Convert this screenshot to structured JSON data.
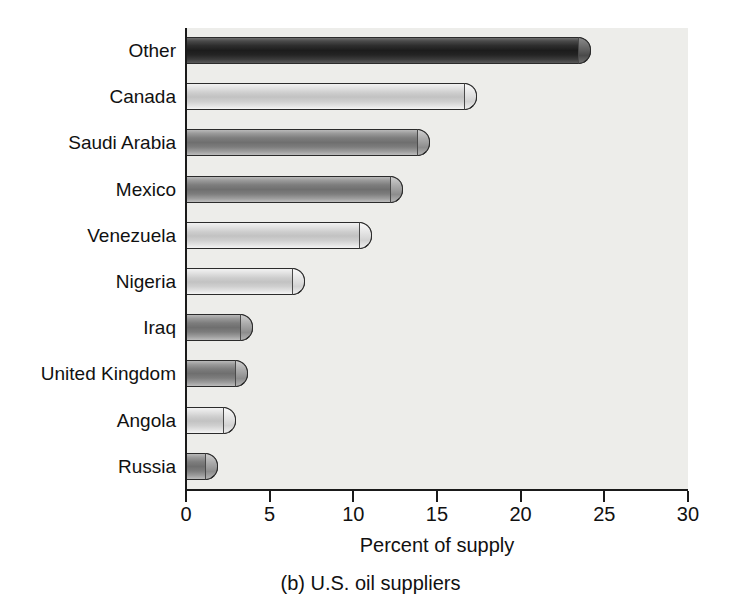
{
  "chart_data": {
    "type": "bar",
    "orientation": "horizontal",
    "title": "",
    "caption": "(b) U.S. oil suppliers",
    "xlabel": "Percent of supply",
    "ylabel": "",
    "xlim": [
      0,
      30
    ],
    "xticks": [
      0,
      5,
      10,
      15,
      20,
      25,
      30
    ],
    "xticklabels": [
      "0",
      "5",
      "10",
      "15",
      "20",
      "25",
      "30"
    ],
    "grid": false,
    "legend": null,
    "categories": [
      "Other",
      "Canada",
      "Saudi Arabia",
      "Mexico",
      "Venezuela",
      "Nigeria",
      "Iraq",
      "United Kingdom",
      "Angola",
      "Russia"
    ],
    "values": [
      24.2,
      17.4,
      14.6,
      13.0,
      11.1,
      7.1,
      4.0,
      3.7,
      3.0,
      1.9
    ],
    "bars": [
      {
        "label": "Other",
        "value": 24.2,
        "tone": "tone-dark"
      },
      {
        "label": "Canada",
        "value": 17.4,
        "tone": "tone-light"
      },
      {
        "label": "Saudi Arabia",
        "value": 14.6,
        "tone": "tone-mid"
      },
      {
        "label": "Mexico",
        "value": 13.0,
        "tone": "tone-mid"
      },
      {
        "label": "Venezuela",
        "value": 11.1,
        "tone": "tone-light"
      },
      {
        "label": "Nigeria",
        "value": 7.1,
        "tone": "tone-light"
      },
      {
        "label": "Iraq",
        "value": 4.0,
        "tone": "tone-mid"
      },
      {
        "label": "United Kingdom",
        "value": 3.7,
        "tone": "tone-mid"
      },
      {
        "label": "Angola",
        "value": 3.0,
        "tone": "tone-light"
      },
      {
        "label": "Russia",
        "value": 1.9,
        "tone": "tone-mid"
      }
    ],
    "colors": {
      "plot_background": "#ededea",
      "page_background": "#ffffff",
      "axis": "#1a1a1a",
      "text": "#111111",
      "bar_dark": "#2e2e2e",
      "bar_mid": "#7d7d7d",
      "bar_light": "#cdcdcd"
    }
  }
}
